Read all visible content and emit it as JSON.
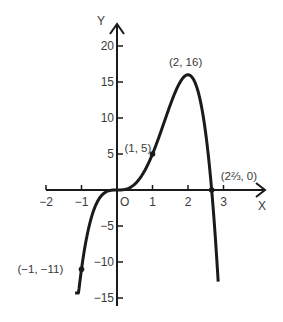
{
  "chart_data": {
    "type": "line",
    "title": "",
    "function": "y = 8x^3 - 3x^4",
    "xlabel": "X",
    "ylabel": "Y",
    "origin_label": "O",
    "xlim": [
      -2.2,
      4.0
    ],
    "ylim": [
      -16,
      23
    ],
    "x_ticks": [
      -2,
      -1,
      1,
      2,
      3
    ],
    "x_tick_labels": [
      "−2",
      "−1",
      "1",
      "2",
      "3"
    ],
    "y_ticks": [
      20,
      15,
      10,
      5,
      -5,
      -10,
      -15
    ],
    "y_tick_labels": [
      "20",
      "15",
      "10",
      "5",
      "−5",
      "−10",
      "−15"
    ],
    "grid": false,
    "legend": null,
    "series": [
      {
        "name": "curve",
        "x_range": [
          -1.18,
          2.85
        ],
        "points": [
          {
            "x": -1.1,
            "y": -13.5
          },
          {
            "x": -1,
            "y": -11
          },
          {
            "x": -0.5,
            "y": -1.19
          },
          {
            "x": 0,
            "y": 0
          },
          {
            "x": 0.5,
            "y": 0.81
          },
          {
            "x": 1,
            "y": 5
          },
          {
            "x": 1.5,
            "y": 11.81
          },
          {
            "x": 2,
            "y": 16
          },
          {
            "x": 2.5,
            "y": 7.81
          },
          {
            "x": 2.6667,
            "y": 0
          },
          {
            "x": 2.8,
            "y": -13.3
          }
        ]
      }
    ],
    "annotations": [
      {
        "label": "(−1, −11)",
        "x": -1,
        "y": -11,
        "marked": true
      },
      {
        "label": "(1, 5)",
        "x": 1,
        "y": 5,
        "marked": true
      },
      {
        "label": "(2, 16)",
        "x": 2,
        "y": 16,
        "marked": false
      },
      {
        "label": "(2⅔, 0)",
        "x": 2.6667,
        "y": 0,
        "marked": true
      }
    ]
  },
  "style": {
    "ink": "#1a1a1a",
    "text": "#3a3a3a",
    "background": "#ffffff"
  }
}
